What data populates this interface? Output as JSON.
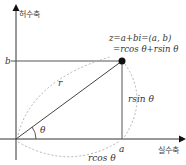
{
  "diagram": {
    "axes": {
      "imaginary_label": "허수축",
      "real_label": "실수축"
    },
    "labels": {
      "b": "b",
      "a": "a",
      "r": "r",
      "theta": "θ",
      "rsin": "rsin θ",
      "rcos": "rcos θ",
      "eq_line1": "z=a+bi=(a,  b)",
      "eq_line2": "=rcos θ+rsin θ"
    },
    "colors": {
      "axis": "#333333",
      "line": "#444444",
      "dotted": "#aaaaaa",
      "point": "#111111"
    }
  }
}
